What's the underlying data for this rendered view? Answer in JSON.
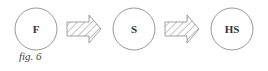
{
  "diagram": {
    "nodes": [
      {
        "id": "F",
        "label": "F"
      },
      {
        "id": "S",
        "label": "S"
      },
      {
        "id": "HS",
        "label": "HS"
      }
    ],
    "edges": [
      {
        "from": "F",
        "to": "S",
        "style": "hatched-block-arrow"
      },
      {
        "from": "S",
        "to": "HS",
        "style": "hatched-block-arrow"
      }
    ],
    "caption": "fig. 6",
    "colors": {
      "stroke": "#888888",
      "text": "#333333",
      "background": "#ffffff"
    }
  }
}
